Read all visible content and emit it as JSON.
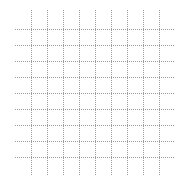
{
  "canvas": {
    "width": 185,
    "height": 181,
    "background": "#ffffff"
  },
  "grid": {
    "line_color": "#9c9c9c",
    "line_style": "dotted",
    "line_width": 1,
    "horizontal_lines": {
      "y_positions": [
        29,
        45,
        61,
        77,
        93,
        109,
        125,
        141,
        157
      ],
      "x_start": 15,
      "x_end": 175
    },
    "vertical_lines": {
      "x_positions": [
        31,
        47,
        63,
        79,
        95,
        111,
        127,
        143,
        159
      ],
      "y_start": 10,
      "y_end": 175
    }
  }
}
